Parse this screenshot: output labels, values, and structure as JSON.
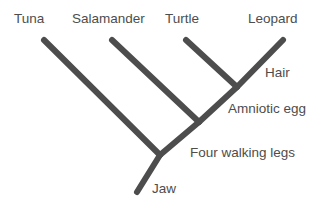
{
  "figure": {
    "type": "cladogram",
    "title": "",
    "background_color": "#ffffff",
    "line_color": "#4d4d4d",
    "text_color": "#4d4d4d",
    "line_width": 6
  },
  "taxa": [
    {
      "id": "tuna",
      "label": "Tuna",
      "tip_x": 44,
      "tip_y": 40
    },
    {
      "id": "salamander",
      "label": "Salamander",
      "tip_x": 112,
      "tip_y": 40
    },
    {
      "id": "turtle",
      "label": "Turtle",
      "tip_x": 186,
      "tip_y": 40
    },
    {
      "id": "leopard",
      "label": "Leopard",
      "tip_x": 283,
      "tip_y": 40
    }
  ],
  "traits": [
    {
      "id": "hair",
      "label": "Hair",
      "node_x": 237,
      "node_y": 87
    },
    {
      "id": "amniotic-egg",
      "label": "Amniotic egg",
      "node_x": 237,
      "node_y": 87
    },
    {
      "id": "four-walking-legs",
      "label": "Four walking legs",
      "node_x": 199,
      "node_y": 122
    },
    {
      "id": "jaw",
      "label": "Jaw",
      "node_x": 160,
      "node_y": 155
    }
  ],
  "nodes": {
    "root_base": {
      "x": 137,
      "y": 192
    },
    "jaw_node": {
      "x": 160,
      "y": 155
    },
    "tetrapod_node": {
      "x": 199,
      "y": 122
    },
    "amniote_node": {
      "x": 237,
      "y": 87
    }
  },
  "branches": [
    {
      "id": "root-stem",
      "from": "root_base",
      "to": "jaw_node"
    },
    {
      "id": "tuna-branch",
      "from": "jaw_node",
      "to": "tuna_tip"
    },
    {
      "id": "jaw-to-tetrapod",
      "from": "jaw_node",
      "to": "tetrapod_node"
    },
    {
      "id": "salamander-branch",
      "from": "tetrapod_node",
      "to": "salamander_tip"
    },
    {
      "id": "tetrapod-to-amniote",
      "from": "tetrapod_node",
      "to": "amniote_node"
    },
    {
      "id": "turtle-branch",
      "from": "amniote_node",
      "to": "turtle_tip"
    },
    {
      "id": "leopard-branch",
      "from": "amniote_node",
      "to": "leopard_tip"
    }
  ],
  "label_positions": {
    "tuna": {
      "x": 14,
      "y": 12
    },
    "salamander": {
      "x": 72,
      "y": 12
    },
    "turtle": {
      "x": 165,
      "y": 12
    },
    "leopard": {
      "x": 248,
      "y": 12
    },
    "hair": {
      "x": 265,
      "y": 66
    },
    "amniotic_egg": {
      "x": 228,
      "y": 102
    },
    "four_walking_legs": {
      "x": 190,
      "y": 146
    },
    "jaw": {
      "x": 152,
      "y": 182
    }
  }
}
